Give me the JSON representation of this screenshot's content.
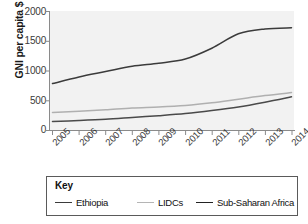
{
  "chart_data": {
    "type": "line",
    "title": "",
    "xlabel": "",
    "ylabel": "GNI per capita $",
    "x": [
      2005,
      2006,
      2007,
      2008,
      2009,
      2010,
      2011,
      2012,
      2013,
      2014
    ],
    "xtick_labels": [
      "2005",
      "2006",
      "2007",
      "2008",
      "2009",
      "2010",
      "2011",
      "2012",
      "2013",
      "2014"
    ],
    "ytick_labels": [
      "0",
      "500",
      "1000",
      "1500",
      "2000"
    ],
    "ytick_values": [
      0,
      500,
      1000,
      1500,
      2000
    ],
    "ylim": [
      0,
      2000
    ],
    "xlim": [
      2005,
      2014
    ],
    "grid": false,
    "legend_position": "below",
    "legend_title": "Key",
    "series": [
      {
        "name": "Sub-Saharan Africa",
        "color": "#3b3b3b",
        "values": [
          790,
          900,
          990,
          1080,
          1130,
          1200,
          1380,
          1620,
          1700,
          1720
        ]
      },
      {
        "name": "LIDCs",
        "color": "#b0b0b0",
        "values": [
          310,
          330,
          355,
          385,
          400,
          425,
          470,
          530,
          590,
          640
        ]
      },
      {
        "name": "Ethiopia",
        "color": "#4a4a4a",
        "values": [
          160,
          175,
          195,
          225,
          255,
          290,
          340,
          400,
          480,
          570
        ]
      }
    ]
  },
  "legend": {
    "title": "Key",
    "entries": [
      {
        "label": "Ethiopia",
        "color": "#3b3b3b"
      },
      {
        "label": "LIDCs",
        "color": "#b5b5b5"
      },
      {
        "label": "Sub-Saharan Africa",
        "color": "#222222"
      }
    ]
  },
  "axes": {
    "y_axis_label": "GNI per capita $",
    "y_ticks": [
      "2000",
      "1500",
      "1000",
      "500",
      "0"
    ],
    "x_ticks": [
      "2005",
      "2006",
      "2007",
      "2008",
      "2009",
      "2010",
      "2011",
      "2012",
      "2013",
      "2014"
    ]
  },
  "colors": {
    "plot_background": "#f2f2f2",
    "axis": "#8a8a8a",
    "text": "#222222"
  }
}
